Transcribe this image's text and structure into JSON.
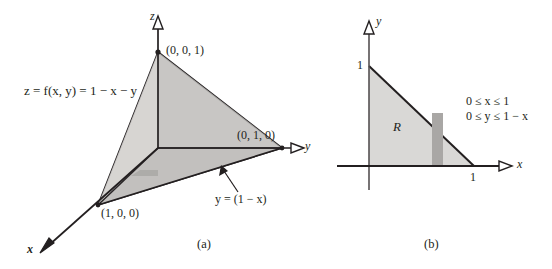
{
  "figure": {
    "panels": [
      {
        "caption": "(a)",
        "type": "3d-plane-tetrahedron",
        "axes": [
          {
            "name": "z-axis",
            "label": "z",
            "arrowhead": "hollow-triangle"
          },
          {
            "name": "y-axis",
            "label": "y",
            "arrowhead": "hollow-triangle"
          },
          {
            "name": "x-axis",
            "label": "x",
            "arrowhead": "solid"
          }
        ],
        "equation_label": "z = f(x, y) = 1 − x − y",
        "vertex_labels": [
          {
            "name": "point-001",
            "text": "(0, 0, 1)"
          },
          {
            "name": "point-010",
            "text": "(0, 1, 0)"
          },
          {
            "name": "point-100",
            "text": "(1, 0, 0)"
          }
        ],
        "edge_label": "y = (1 − x)"
      },
      {
        "caption": "(b)",
        "type": "2d-region",
        "axes": [
          {
            "name": "y-axis",
            "label": "y",
            "arrowhead": "hollow-triangle"
          },
          {
            "name": "x-axis",
            "label": "x",
            "arrowhead": "hollow-triangle"
          }
        ],
        "tick_labels": [
          {
            "name": "y-tick-1",
            "text": "1"
          },
          {
            "name": "x-tick-1",
            "text": "1"
          }
        ],
        "region_label": "R",
        "inequalities": [
          "0 ≤ x ≤ 1",
          "0 ≤ y ≤ 1 − x"
        ]
      }
    ]
  },
  "colors": {
    "ink": "#231f20",
    "plane_light": "#d6d4d2",
    "plane_mid": "#c9c7c5",
    "plane_dark": "#bdbbb9",
    "region_fill": "#d9d8d6",
    "strip_fill": "#a9a7a5",
    "paper": "#ffffff"
  }
}
